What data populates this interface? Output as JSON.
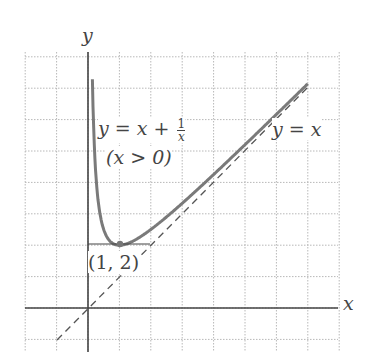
{
  "chart_data": {
    "type": "line",
    "title": "",
    "xlabel": "x",
    "ylabel": "y",
    "xlim": [
      -2,
      8
    ],
    "ylim": [
      -1,
      8
    ],
    "grid": true,
    "series": [
      {
        "name": "y = x + 1/x (x > 0)",
        "style": "solid",
        "color": "#777777",
        "x": [
          0.14,
          0.2,
          0.3,
          0.5,
          0.7,
          1,
          1.5,
          2,
          3,
          4,
          5,
          6,
          7
        ],
        "y": [
          7.28,
          5.2,
          3.63,
          2.5,
          2.13,
          2,
          2.17,
          2.5,
          3.33,
          4.25,
          5.2,
          6.17,
          7.14
        ]
      },
      {
        "name": "y = x",
        "style": "dashed",
        "color": "#555555",
        "x": [
          -1,
          7
        ],
        "y": [
          -1,
          7
        ]
      }
    ],
    "annotations": [
      {
        "text": "(1, 2)",
        "x": 1,
        "y": 2,
        "marker": true
      }
    ]
  },
  "labels": {
    "y_axis": "y",
    "x_axis": "x",
    "curve_eq_left": "y = x + ",
    "curve_frac_num": "1",
    "curve_frac_den": "x",
    "curve_domain": "(x > 0)",
    "line_eq": "y = x",
    "min_point": "(1, 2)"
  },
  "colors": {
    "grid": "#b5b5b5",
    "axis": "#444444",
    "curve": "#7a7a7a",
    "dashed": "#555555"
  }
}
